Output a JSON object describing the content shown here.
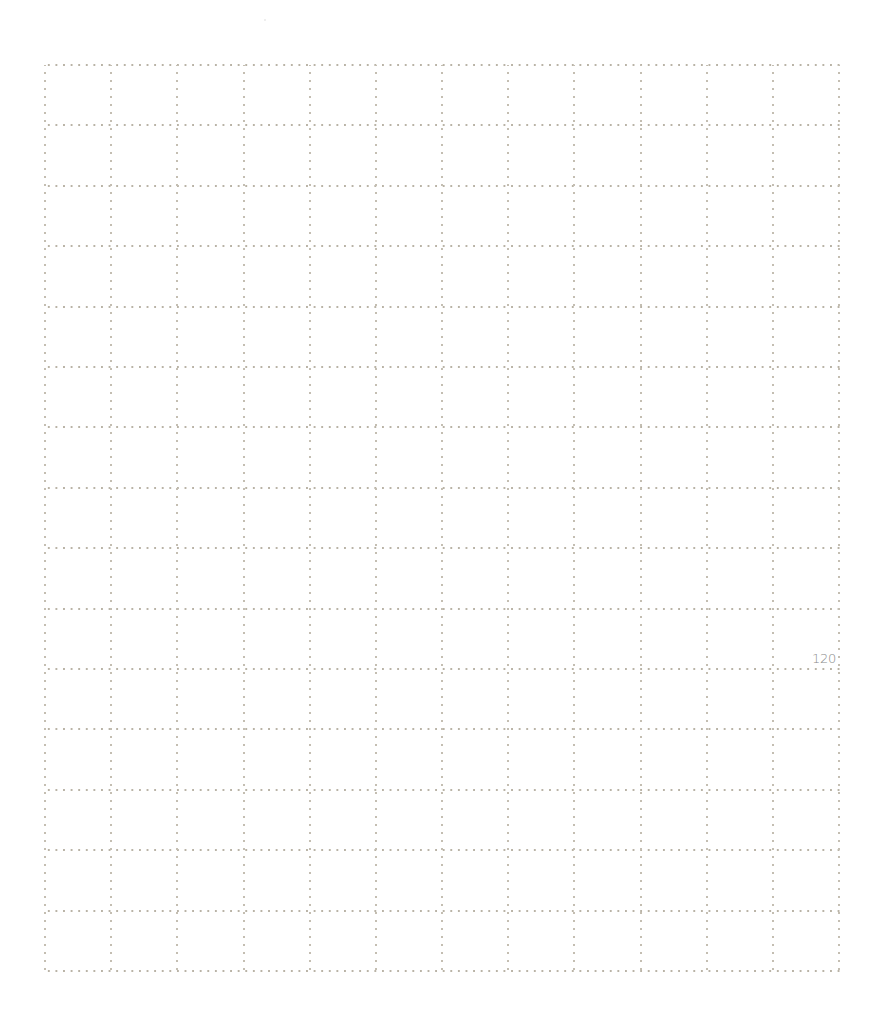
{
  "page": {
    "type": "grid-notebook-page",
    "page_number": "120",
    "background_color": "#ffffff",
    "grid": {
      "columns": 12,
      "rows": 15,
      "line_style": "dotted",
      "line_color": "#b9b3a6",
      "left": 45,
      "top": 65,
      "width": 794,
      "height": 906
    }
  }
}
